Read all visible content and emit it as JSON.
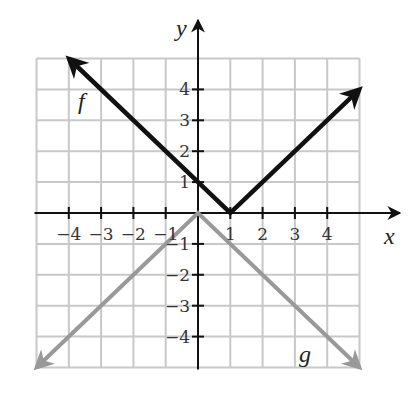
{
  "chart_data": {
    "type": "line",
    "title": "",
    "xlabel": "x",
    "ylabel": "y",
    "xlim": [
      -5,
      5
    ],
    "ylim": [
      -5,
      5
    ],
    "grid": true,
    "x_ticks": [
      -4,
      -3,
      -2,
      -1,
      1,
      2,
      3,
      4
    ],
    "y_ticks": [
      -4,
      -3,
      -2,
      -1,
      1,
      2,
      3,
      4
    ],
    "x_tick_labels": [
      "−4",
      "−3",
      "−2",
      "−1",
      "1",
      "2",
      "3",
      "4"
    ],
    "y_tick_labels": [
      "−4",
      "−3",
      "−2",
      "−1",
      "1",
      "2",
      "3",
      "4"
    ],
    "series": [
      {
        "name": "f",
        "equation": "f(x) = |x - 1|",
        "color": "#111111",
        "points": [
          [
            -4,
            5
          ],
          [
            1,
            0
          ],
          [
            5,
            4
          ]
        ],
        "arrows": "both"
      },
      {
        "name": "g",
        "equation": "g(x) = -|x|",
        "color": "#999999",
        "points": [
          [
            -5,
            -5
          ],
          [
            0,
            0
          ],
          [
            5,
            -5
          ]
        ],
        "arrows": "both"
      }
    ],
    "legend": "inline labels"
  },
  "labels": {
    "x_axis": "x",
    "y_axis": "y",
    "f": "f",
    "g": "g"
  },
  "colors": {
    "grid": "#c8c8c8",
    "axis": "#111111",
    "f": "#111111",
    "g": "#999999"
  }
}
